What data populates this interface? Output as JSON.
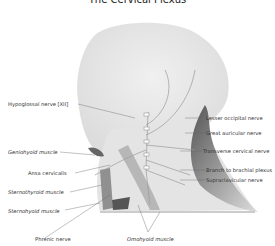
{
  "title": "The Cervical Plexus",
  "labels_left": [
    {
      "id": "hypoglossal",
      "text": "Hypoglossal nerve [XII]",
      "italic": false
    },
    {
      "id": "geniohyoid",
      "text": "Geniohyoid muscle",
      "italic": true
    },
    {
      "id": "ansa",
      "text": "Ansa cervicalis",
      "italic": false
    },
    {
      "id": "sternothyroid",
      "text": "Sternothyroid muscle",
      "italic": true
    },
    {
      "id": "sternohyoid",
      "text": "Sternohyoid muscle",
      "italic": true
    },
    {
      "id": "phrenic",
      "text": "Phrenic nerve",
      "italic": false
    }
  ],
  "labels_right": [
    {
      "id": "lesser_occipital",
      "text": "Lesser occipital nerve"
    },
    {
      "id": "great_auricular",
      "text": "Great auricular nerve"
    },
    {
      "id": "transverse_cervical",
      "text": "Transverse cervical nerve"
    },
    {
      "id": "brachial_branch",
      "text": "Branch to brachial plexus"
    },
    {
      "id": "supraclavicular",
      "text": "Supraclavicular nerve"
    }
  ],
  "labels_bottom": [
    {
      "id": "omohyoid",
      "text": "Omohyoid muscle",
      "italic": true
    }
  ],
  "vertebra_labels": [
    "C1",
    "C2",
    "C3",
    "C4",
    "C5"
  ],
  "colors": {
    "skin": "#e6e6e6",
    "muscle": "#8a8a8a",
    "nerve": "#9a9a9a",
    "leader": "#666666"
  }
}
